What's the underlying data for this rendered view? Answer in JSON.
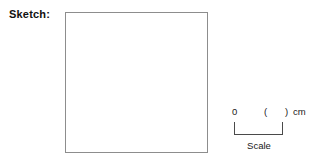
{
  "sketch": {
    "label": "Sketch:",
    "box_content": ""
  },
  "scale_legend": {
    "zero_label": "0",
    "paren_open": "(",
    "paren_close": ")",
    "value": "",
    "unit_label": "cm",
    "caption": "Scale"
  },
  "colors": {
    "background": "#ffffff",
    "box_border": "#8d8d8d",
    "scale_line": "#4a4a4a",
    "text": "#202020",
    "label_text": "#111111"
  }
}
